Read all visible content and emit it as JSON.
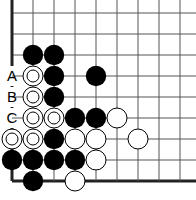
{
  "diagram": {
    "grid": {
      "origin_x": 12,
      "origin_y": 13,
      "spacing": 21,
      "cols": 9,
      "rows": 9,
      "left_edge": true,
      "bottom_edge": true,
      "line_color": "#555555",
      "edge_color": "#222222"
    },
    "stones": [
      {
        "col": 1,
        "row": 2,
        "color": "black"
      },
      {
        "col": 2,
        "row": 2,
        "color": "black"
      },
      {
        "col": 1,
        "row": 3,
        "color": "white",
        "marked": true
      },
      {
        "col": 2,
        "row": 3,
        "color": "black"
      },
      {
        "col": 4,
        "row": 3,
        "color": "black"
      },
      {
        "col": 1,
        "row": 4,
        "color": "white",
        "marked": true
      },
      {
        "col": 2,
        "row": 4,
        "color": "black"
      },
      {
        "col": 1,
        "row": 5,
        "color": "white",
        "marked": true
      },
      {
        "col": 2,
        "row": 5,
        "color": "white",
        "marked": true
      },
      {
        "col": 3,
        "row": 5,
        "color": "black"
      },
      {
        "col": 4,
        "row": 5,
        "color": "black"
      },
      {
        "col": 5,
        "row": 5,
        "color": "white"
      },
      {
        "col": 0,
        "row": 6,
        "color": "white",
        "marked": true
      },
      {
        "col": 1,
        "row": 6,
        "color": "white",
        "marked": true
      },
      {
        "col": 2,
        "row": 6,
        "color": "black"
      },
      {
        "col": 3,
        "row": 6,
        "color": "white"
      },
      {
        "col": 4,
        "row": 6,
        "color": "white"
      },
      {
        "col": 6,
        "row": 6,
        "color": "white"
      },
      {
        "col": 0,
        "row": 7,
        "color": "black"
      },
      {
        "col": 1,
        "row": 7,
        "color": "black"
      },
      {
        "col": 2,
        "row": 7,
        "color": "black"
      },
      {
        "col": 3,
        "row": 7,
        "color": "black"
      },
      {
        "col": 4,
        "row": 7,
        "color": "white"
      },
      {
        "col": 1,
        "row": 8,
        "color": "black"
      },
      {
        "col": 3,
        "row": 8,
        "color": "white"
      }
    ],
    "labels": [
      {
        "col": 0,
        "row": 3,
        "text": "A"
      },
      {
        "col": 0,
        "row": 4,
        "text": "B"
      },
      {
        "col": 0,
        "row": 5,
        "text": "C"
      }
    ]
  }
}
